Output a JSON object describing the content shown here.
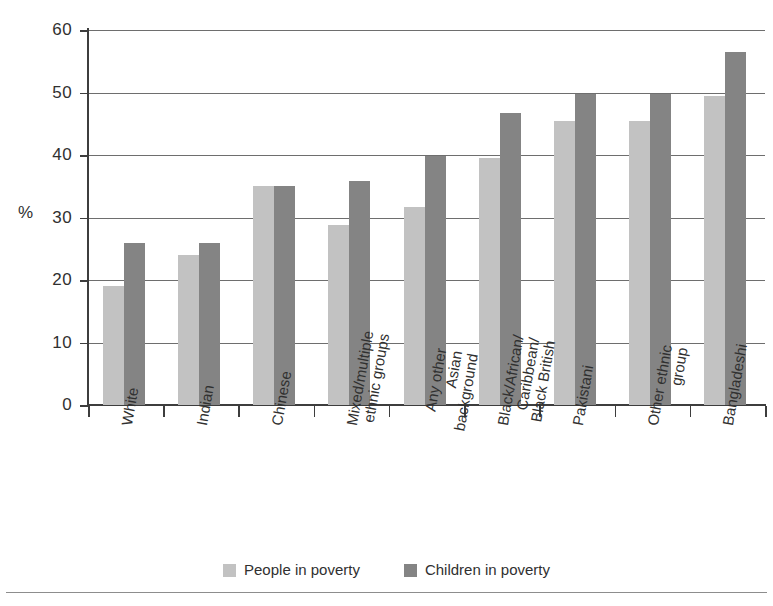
{
  "chart_data": {
    "type": "bar",
    "title": "",
    "xlabel": "",
    "ylabel": "%",
    "ylim": [
      0,
      60
    ],
    "ytick_step": 10,
    "yticks": [
      0,
      10,
      20,
      30,
      40,
      50,
      60
    ],
    "grid": true,
    "legend_position": "bottom-center",
    "categories": [
      "White",
      "Indian",
      "Chinese",
      "Mixed/multiple ethnic groups",
      "Any other Asian background",
      "Black/African/Caribbean/Black British",
      "Pakistani",
      "Other ethnic group",
      "Bangladeshi"
    ],
    "category_lines": [
      [
        "White"
      ],
      [
        "Indian"
      ],
      [
        "Chinese"
      ],
      [
        "Mixed/multiple",
        "ethnic groups"
      ],
      [
        "Any other",
        "Asian",
        "background"
      ],
      [
        "Black/African/",
        "Caribbean/",
        "Black British"
      ],
      [
        "Pakistani"
      ],
      [
        "Other ethnic",
        "group"
      ],
      [
        "Bangladeshi"
      ]
    ],
    "series": [
      {
        "name": "People in poverty",
        "color": "#c2c2c2",
        "values": [
          19.0,
          24.0,
          35.0,
          28.8,
          31.7,
          39.6,
          45.5,
          45.4,
          49.4
        ]
      },
      {
        "name": "Children in poverty",
        "color": "#848484",
        "values": [
          26.0,
          26.0,
          35.0,
          35.8,
          39.8,
          46.7,
          49.7,
          49.7,
          56.5
        ]
      }
    ]
  },
  "legend": {
    "items": [
      {
        "label": "People in poverty",
        "color": "#c2c2c2"
      },
      {
        "label": "Children in poverty",
        "color": "#848484"
      }
    ]
  },
  "axis": {
    "y_title": "%"
  }
}
